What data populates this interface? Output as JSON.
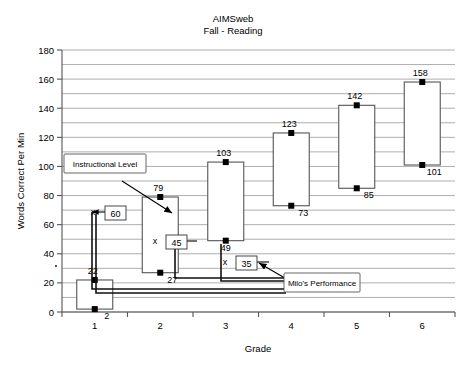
{
  "chart_data": {
    "type": "bar",
    "title": "AIMSweb",
    "subtitle": "Fall - Reading",
    "xlabel": "Grade",
    "ylabel": "Words Correct Per Min",
    "ylim": [
      0,
      180
    ],
    "ytick_step": 20,
    "yminor_step": 10,
    "grid": true,
    "legend": "none",
    "categories": [
      "1",
      "2",
      "3",
      "4",
      "5",
      "6"
    ],
    "series": [
      {
        "name": "Upper Bound (top of box)",
        "values": [
          22,
          79,
          103,
          123,
          142,
          158
        ]
      },
      {
        "name": "Lower Bound (bottom of box)",
        "values": [
          2,
          27,
          49,
          73,
          85,
          101
        ]
      }
    ],
    "ytick_labels": [
      "0",
      "20",
      "40",
      "60",
      "80",
      "100",
      "120",
      "140",
      "160",
      "180"
    ],
    "xtick_labels": [
      "1",
      "2",
      "3",
      "4",
      "5",
      "6"
    ],
    "annotations": [
      {
        "name": "instructional-level",
        "label": "Instructional Level",
        "points_to": "grade-2-box"
      },
      {
        "name": "milos-performance",
        "label": "Milo's Performance",
        "points_to": "value-35"
      }
    ],
    "student_values": [
      {
        "name": "value-60",
        "mark": "x",
        "value": "60",
        "grade": "2"
      },
      {
        "name": "value-45",
        "mark": "x",
        "value": "45",
        "grade": "3"
      },
      {
        "name": "value-35",
        "mark": "x",
        "value": "35",
        "grade": "4"
      }
    ],
    "point_labels": {
      "tops": [
        "22",
        "79",
        "103",
        "123",
        "142",
        "158"
      ],
      "bottoms": [
        "2",
        "27",
        "49",
        "73",
        "85",
        "101"
      ]
    }
  }
}
